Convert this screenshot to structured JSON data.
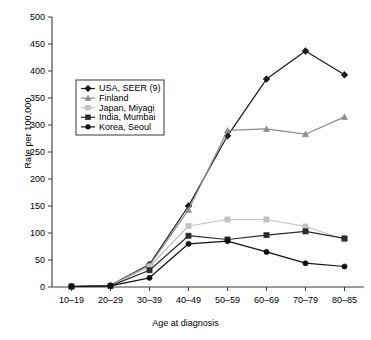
{
  "chart_data": {
    "type": "line",
    "title": "",
    "xlabel": "Age at diagnosis",
    "ylabel": "Rate per 100,000",
    "categories": [
      "10–19",
      "20–29",
      "30–39",
      "40–49",
      "50–59",
      "60–69",
      "70–79",
      "80–85"
    ],
    "ylim": [
      0,
      500
    ],
    "yticks": [
      0,
      50,
      100,
      150,
      200,
      250,
      300,
      350,
      400,
      450,
      500
    ],
    "grid": false,
    "legend_position": "upper-left-inside",
    "series": [
      {
        "name": "USA, SEER (9)",
        "color": "#1a1a1a",
        "marker": "diamond",
        "values": [
          1,
          3,
          42,
          150,
          280,
          385,
          437,
          393
        ]
      },
      {
        "name": "Finland",
        "color": "#8c8c8c",
        "marker": "triangle",
        "values": [
          1,
          3,
          40,
          143,
          290,
          293,
          283,
          315
        ]
      },
      {
        "name": "Japan, Miyagi",
        "color": "#c2c2c2",
        "marker": "square",
        "values": [
          1,
          2,
          38,
          113,
          125,
          125,
          112,
          88
        ]
      },
      {
        "name": "India, Mumbai",
        "color": "#2b2b2b",
        "marker": "square",
        "values": [
          1,
          2,
          31,
          95,
          88,
          96,
          103,
          90
        ]
      },
      {
        "name": "Korea, Seoul",
        "color": "#111111",
        "marker": "circle",
        "values": [
          1,
          2,
          17,
          80,
          85,
          65,
          44,
          38
        ]
      }
    ]
  },
  "legend": {
    "items": [
      {
        "label": "USA, SEER (9)"
      },
      {
        "label": "Finland"
      },
      {
        "label": "Japan, Miyagi"
      },
      {
        "label": "India, Mumbai"
      },
      {
        "label": "Korea, Seoul"
      }
    ]
  }
}
